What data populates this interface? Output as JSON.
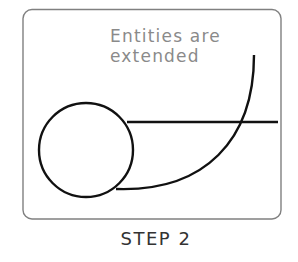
{
  "diagram": {
    "annotation": {
      "line1": "Entities are",
      "line2": "extended",
      "color": "#8a8a8a"
    },
    "caption": "STEP 2",
    "caption_color": "#333333",
    "frame_color": "#808080",
    "stroke_color": "#111111",
    "entities": [
      {
        "type": "circle",
        "cx": 86,
        "cy": 150,
        "r": 47
      },
      {
        "type": "line",
        "x1": 127,
        "y1": 122,
        "x2": 278,
        "y2": 122
      },
      {
        "type": "arc",
        "from": [
          254,
          55
        ],
        "to": [
          116,
          189
        ]
      }
    ]
  }
}
